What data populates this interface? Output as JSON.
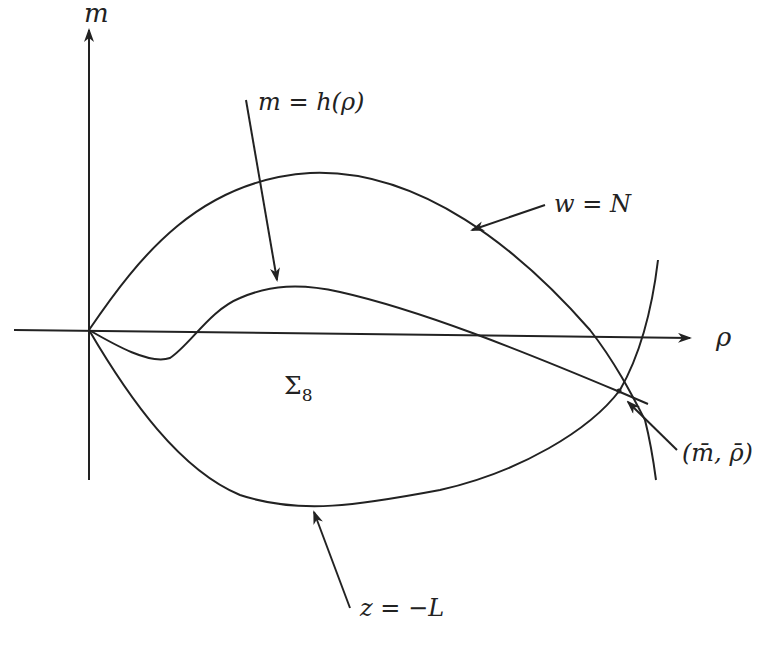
{
  "diagram": {
    "type": "phase-plane-sketch",
    "stroke_color": "#222222",
    "background": "#ffffff",
    "axes": {
      "x_label": "ρ",
      "y_label": "m"
    },
    "region_label": {
      "base": "Σ",
      "subscript": "8"
    },
    "curves": [
      {
        "id": "w-equals-N",
        "label": "w = N",
        "description": "upper arc from origin peaking above, descending to intersection point"
      },
      {
        "id": "m-equals-h-rho",
        "label": "m = h(ρ)",
        "description": "dips below ρ-axis near origin, rises to a hump, decreases through intersection"
      },
      {
        "id": "z-equals-minus-L",
        "label": "z = −L",
        "description": "lower arc from origin dipping below, rising to the right"
      }
    ],
    "labels": {
      "h_curve": {
        "lhs": "m",
        "eq": " = ",
        "rhs": "h(ρ)"
      },
      "w_curve": {
        "lhs": "w",
        "eq": " = ",
        "rhs": "N"
      },
      "z_curve": {
        "lhs": "z",
        "eq": " = ",
        "rhs": "−L"
      },
      "point": {
        "text": "(m̄, ρ̄)"
      }
    }
  }
}
